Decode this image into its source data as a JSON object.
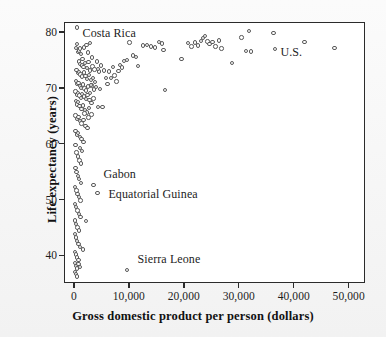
{
  "chart_data": {
    "type": "scatter",
    "title": "",
    "xlabel": "Gross domestic product per person (dollars)",
    "ylabel": "Life expectancy (years)",
    "xlim": [
      -1800,
      52600
    ],
    "ylim": [
      35.4,
      81.8
    ],
    "grid": false,
    "legend": null,
    "xticks": [
      0,
      10000,
      20000,
      30000,
      40000,
      50000
    ],
    "xticklabels": [
      "0",
      "10,000",
      "20,000",
      "30,000",
      "40,000",
      "50,000"
    ],
    "yticks": [
      40,
      50,
      60,
      70,
      80
    ],
    "yticklabels": [
      "40",
      "50",
      "60",
      "70",
      "80"
    ],
    "marker": "open-circle",
    "marker_color": "#595959",
    "marker_fill": "#ffffff",
    "annotations": [
      {
        "text": "Costa Rica",
        "x": 1400,
        "y": 79.9,
        "align": "left"
      },
      {
        "text": "Gabon",
        "x": 5200,
        "y": 54.6,
        "align": "left"
      },
      {
        "text": "Equatorial Guinea",
        "x": 6100,
        "y": 50.9,
        "align": "left"
      },
      {
        "text": "Sierra Leone",
        "x": 11400,
        "y": 39.3,
        "align": "left"
      },
      {
        "text": "U.S.",
        "x": 37400,
        "y": 76.4,
        "align": "left"
      }
    ],
    "points": [
      [
        420,
        81.0
      ],
      [
        330,
        78.0
      ],
      [
        250,
        77.3
      ],
      [
        560,
        76.6
      ],
      [
        700,
        76.9
      ],
      [
        900,
        77.2
      ],
      [
        1150,
        76.3
      ],
      [
        1400,
        75.4
      ],
      [
        1700,
        77.4
      ],
      [
        2100,
        77.9
      ],
      [
        2400,
        76.5
      ],
      [
        2700,
        78.2
      ],
      [
        3100,
        75.6
      ],
      [
        700,
        74.9
      ],
      [
        950,
        74.5
      ],
      [
        1250,
        74.2
      ],
      [
        1550,
        73.9
      ],
      [
        1850,
        74.6
      ],
      [
        2150,
        73.7
      ],
      [
        2500,
        74.8
      ],
      [
        2800,
        73.3
      ],
      [
        3200,
        74.0
      ],
      [
        3600,
        73.5
      ],
      [
        4000,
        74.9
      ],
      [
        4400,
        73.1
      ],
      [
        300,
        73.4
      ],
      [
        520,
        72.8
      ],
      [
        760,
        73.0
      ],
      [
        1000,
        72.6
      ],
      [
        1300,
        72.2
      ],
      [
        1600,
        72.9
      ],
      [
        1900,
        72.3
      ],
      [
        2200,
        71.8
      ],
      [
        2600,
        72.5
      ],
      [
        2950,
        71.6
      ],
      [
        3300,
        72.0
      ],
      [
        3700,
        71.2
      ],
      [
        4200,
        73.6
      ],
      [
        4800,
        74.2
      ],
      [
        5300,
        73.3
      ],
      [
        180,
        71.4
      ],
      [
        400,
        70.9
      ],
      [
        640,
        71.1
      ],
      [
        880,
        70.5
      ],
      [
        1120,
        70.2
      ],
      [
        1420,
        70.8
      ],
      [
        1720,
        70.1
      ],
      [
        2050,
        69.7
      ],
      [
        2380,
        70.4
      ],
      [
        2750,
        69.3
      ],
      [
        3050,
        70.6
      ],
      [
        3450,
        69.9
      ],
      [
        5700,
        72.0
      ],
      [
        6200,
        73.1
      ],
      [
        6900,
        73.9
      ],
      [
        120,
        69.5
      ],
      [
        350,
        69.0
      ],
      [
        580,
        69.3
      ],
      [
        820,
        68.8
      ],
      [
        1060,
        68.4
      ],
      [
        1330,
        69.1
      ],
      [
        1650,
        68.6
      ],
      [
        1980,
        68.2
      ],
      [
        2300,
        68.9
      ],
      [
        2650,
        68.0
      ],
      [
        3000,
        67.5
      ],
      [
        3400,
        68.3
      ],
      [
        7600,
        71.3
      ],
      [
        8200,
        74.3
      ],
      [
        8900,
        75.0
      ],
      [
        160,
        67.8
      ],
      [
        380,
        67.2
      ],
      [
        600,
        67.6
      ],
      [
        860,
        66.9
      ],
      [
        1180,
        66.4
      ],
      [
        1500,
        67.0
      ],
      [
        1820,
        66.2
      ],
      [
        2200,
        65.8
      ],
      [
        2600,
        66.6
      ],
      [
        3000,
        65.4
      ],
      [
        4200,
        66.8
      ],
      [
        9500,
        75.2
      ],
      [
        9900,
        78.3
      ],
      [
        10600,
        76.0
      ],
      [
        11100,
        75.7
      ],
      [
        140,
        65.2
      ],
      [
        370,
        64.6
      ],
      [
        620,
        65.0
      ],
      [
        900,
        64.2
      ],
      [
        1220,
        63.8
      ],
      [
        1560,
        64.4
      ],
      [
        1900,
        63.4
      ],
      [
        2300,
        63.0
      ],
      [
        11500,
        74.1
      ],
      [
        12400,
        77.8
      ],
      [
        13100,
        77.9
      ],
      [
        13900,
        77.6
      ],
      [
        14600,
        77.4
      ],
      [
        15300,
        78.4
      ],
      [
        15800,
        78.1
      ],
      [
        110,
        62.4
      ],
      [
        340,
        61.8
      ],
      [
        610,
        62.1
      ],
      [
        880,
        61.4
      ],
      [
        1200,
        61.0
      ],
      [
        1550,
        60.5
      ],
      [
        16100,
        77.0
      ],
      [
        16400,
        69.8
      ],
      [
        19400,
        75.3
      ],
      [
        20600,
        78.2
      ],
      [
        90,
        59.9
      ],
      [
        300,
        58.6
      ],
      [
        560,
        57.9
      ],
      [
        840,
        57.2
      ],
      [
        1150,
        56.6
      ],
      [
        21200,
        77.6
      ],
      [
        21900,
        78.3
      ],
      [
        22400,
        77.8
      ],
      [
        22900,
        78.6
      ],
      [
        23300,
        79.1
      ],
      [
        80,
        55.8
      ],
      [
        280,
        55.1
      ],
      [
        520,
        54.4
      ],
      [
        790,
        53.8
      ],
      [
        1100,
        53.1
      ],
      [
        23700,
        79.5
      ],
      [
        24100,
        78.5
      ],
      [
        24500,
        78.0
      ],
      [
        25000,
        78.4
      ],
      [
        25600,
        77.6
      ],
      [
        70,
        52.4
      ],
      [
        260,
        51.8
      ],
      [
        500,
        51.2
      ],
      [
        760,
        50.6
      ],
      [
        1050,
        50.0
      ],
      [
        26200,
        78.7
      ],
      [
        26700,
        77.2
      ],
      [
        28600,
        74.6
      ],
      [
        30300,
        79.2
      ],
      [
        31100,
        76.8
      ],
      [
        60,
        49.4
      ],
      [
        240,
        48.8
      ],
      [
        470,
        48.2
      ],
      [
        730,
        47.6
      ],
      [
        1000,
        47.0
      ],
      [
        31700,
        80.4
      ],
      [
        32000,
        76.7
      ],
      [
        36100,
        80.0
      ],
      [
        36400,
        77.1
      ],
      [
        55,
        46.4
      ],
      [
        220,
        45.8
      ],
      [
        450,
        45.2
      ],
      [
        700,
        44.6
      ],
      [
        2000,
        46.3
      ],
      [
        41800,
        78.4
      ],
      [
        47200,
        77.3
      ],
      [
        50,
        44.0
      ],
      [
        210,
        43.4
      ],
      [
        430,
        42.8
      ],
      [
        680,
        42.2
      ],
      [
        960,
        41.7
      ],
      [
        1450,
        41.2
      ],
      [
        45,
        40.8
      ],
      [
        200,
        40.3
      ],
      [
        420,
        39.8
      ],
      [
        660,
        39.3
      ],
      [
        40,
        38.8
      ],
      [
        190,
        38.3
      ],
      [
        400,
        37.8
      ],
      [
        640,
        38.6
      ],
      [
        900,
        38.1
      ],
      [
        35,
        37.2
      ],
      [
        180,
        36.8
      ],
      [
        380,
        36.4
      ],
      [
        3400,
        52.8
      ],
      [
        4100,
        51.3
      ],
      [
        9500,
        37.5
      ],
      [
        5000,
        66.7
      ],
      [
        4600,
        70.0
      ],
      [
        3800,
        70.3
      ],
      [
        2900,
        70.7
      ],
      [
        5900,
        70.9
      ],
      [
        6600,
        71.9
      ],
      [
        7200,
        72.4
      ],
      [
        7900,
        73.2
      ],
      [
        8600,
        73.8
      ],
      [
        1750,
        65.6
      ],
      [
        2450,
        64.9
      ],
      [
        1300,
        58.9
      ],
      [
        950,
        59.4
      ]
    ]
  },
  "axis_color": "#2b2b2b",
  "background": "#f6f6f6"
}
